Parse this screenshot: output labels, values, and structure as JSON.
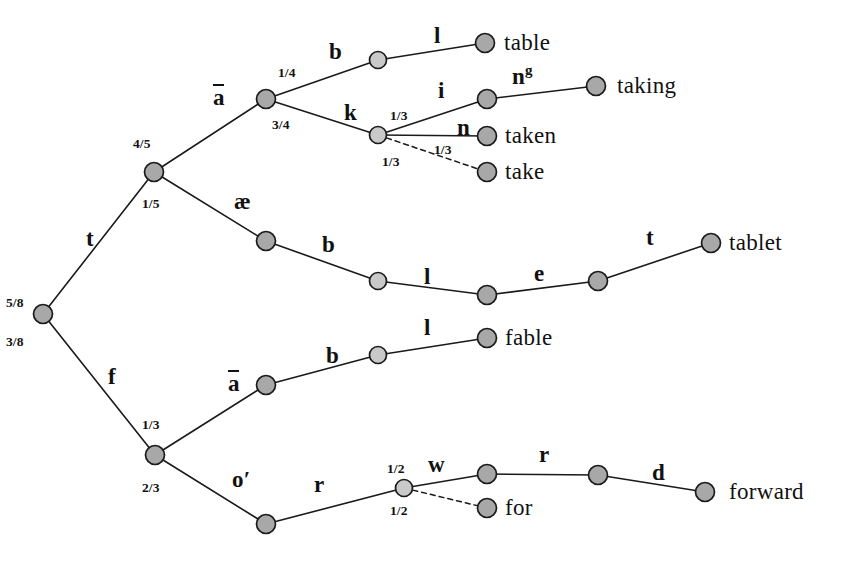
{
  "figure": {
    "type": "probabilistic-lexical-tree",
    "canvas": {
      "width": 847,
      "height": 564,
      "background": "#ffffff"
    },
    "style": {
      "node_fill": "#a8a8a8",
      "node_fill_light": "#c9c9c9",
      "node_stroke": "#1a1a1a",
      "edge_color": "#1a1a1a",
      "text_color": "#111111"
    }
  },
  "nodes": [
    {
      "id": "root",
      "x": 43,
      "y": 314,
      "r": 9.5,
      "shade": "dark"
    },
    {
      "id": "t",
      "x": 154,
      "y": 172,
      "r": 9.5,
      "shade": "dark"
    },
    {
      "id": "f",
      "x": 155,
      "y": 455,
      "r": 9.5,
      "shade": "dark"
    },
    {
      "id": "ta",
      "x": 266,
      "y": 99,
      "r": 9.5,
      "shade": "dark"
    },
    {
      "id": "tae",
      "x": 266,
      "y": 241,
      "r": 9.5,
      "shade": "dark"
    },
    {
      "id": "tab",
      "x": 378,
      "y": 60,
      "r": 8.5,
      "shade": "light"
    },
    {
      "id": "tak",
      "x": 378,
      "y": 135,
      "r": 8.5,
      "shade": "light"
    },
    {
      "id": "table",
      "x": 485,
      "y": 43,
      "r": 9.5,
      "shade": "dark"
    },
    {
      "id": "taki",
      "x": 487,
      "y": 99,
      "r": 9.5,
      "shade": "dark"
    },
    {
      "id": "taken",
      "x": 487,
      "y": 136,
      "r": 9.5,
      "shade": "dark"
    },
    {
      "id": "take",
      "x": 487,
      "y": 172,
      "r": 9.5,
      "shade": "dark"
    },
    {
      "id": "taking",
      "x": 596,
      "y": 86,
      "r": 9.5,
      "shade": "dark"
    },
    {
      "id": "taeb",
      "x": 378,
      "y": 281,
      "r": 8.5,
      "shade": "light"
    },
    {
      "id": "taebl",
      "x": 487,
      "y": 295,
      "r": 9.5,
      "shade": "dark"
    },
    {
      "id": "taeble",
      "x": 598,
      "y": 281,
      "r": 9.5,
      "shade": "dark"
    },
    {
      "id": "tablet",
      "x": 711,
      "y": 243,
      "r": 9.5,
      "shade": "dark"
    },
    {
      "id": "fa",
      "x": 266,
      "y": 385,
      "r": 9.5,
      "shade": "dark"
    },
    {
      "id": "fab",
      "x": 378,
      "y": 355,
      "r": 8.5,
      "shade": "light"
    },
    {
      "id": "fable",
      "x": 487,
      "y": 338,
      "r": 9.5,
      "shade": "dark"
    },
    {
      "id": "fo",
      "x": 266,
      "y": 524,
      "r": 9.5,
      "shade": "dark"
    },
    {
      "id": "for_br",
      "x": 404,
      "y": 488,
      "r": 8.5,
      "shade": "light"
    },
    {
      "id": "forw",
      "x": 487,
      "y": 474,
      "r": 9.5,
      "shade": "dark"
    },
    {
      "id": "for",
      "x": 487,
      "y": 508,
      "r": 9.5,
      "shade": "dark"
    },
    {
      "id": "forwr",
      "x": 598,
      "y": 475,
      "r": 9.5,
      "shade": "dark"
    },
    {
      "id": "forward",
      "x": 705,
      "y": 492,
      "r": 9.5,
      "shade": "dark"
    }
  ],
  "edges": [
    {
      "from": "root",
      "to": "t",
      "symbol": "t",
      "prob": "5/8",
      "dashed": false
    },
    {
      "from": "root",
      "to": "f",
      "symbol": "f",
      "prob": "3/8",
      "dashed": false
    },
    {
      "from": "t",
      "to": "ta",
      "symbol": "a",
      "prob": "4/5",
      "dashed": false
    },
    {
      "from": "t",
      "to": "tae",
      "symbol": "æ",
      "prob": "1/5",
      "dashed": false
    },
    {
      "from": "ta",
      "to": "tab",
      "symbol": "b",
      "prob": "1/4",
      "dashed": false
    },
    {
      "from": "ta",
      "to": "tak",
      "symbol": "k",
      "prob": "3/4",
      "dashed": false
    },
    {
      "from": "tab",
      "to": "table",
      "symbol": "l",
      "prob": "",
      "dashed": false
    },
    {
      "from": "tak",
      "to": "taki",
      "symbol": "i",
      "prob": "1/3",
      "dashed": false
    },
    {
      "from": "tak",
      "to": "taken",
      "symbol": "n",
      "prob": "1/3",
      "dashed": false
    },
    {
      "from": "tak",
      "to": "take",
      "symbol": "",
      "prob": "1/3",
      "dashed": true
    },
    {
      "from": "taki",
      "to": "taking",
      "symbol": "ng",
      "prob": "",
      "dashed": false
    },
    {
      "from": "tae",
      "to": "taeb",
      "symbol": "b",
      "prob": "",
      "dashed": false
    },
    {
      "from": "taeb",
      "to": "taebl",
      "symbol": "l",
      "prob": "",
      "dashed": false
    },
    {
      "from": "taebl",
      "to": "taeble",
      "symbol": "e",
      "prob": "",
      "dashed": false
    },
    {
      "from": "taeble",
      "to": "tablet",
      "symbol": "t",
      "prob": "",
      "dashed": false
    },
    {
      "from": "f",
      "to": "fa",
      "symbol": "a",
      "prob": "1/3",
      "dashed": false
    },
    {
      "from": "f",
      "to": "fo",
      "symbol": "o'",
      "prob": "2/3",
      "dashed": false
    },
    {
      "from": "fa",
      "to": "fab",
      "symbol": "b",
      "prob": "",
      "dashed": false
    },
    {
      "from": "fab",
      "to": "fable",
      "symbol": "l",
      "prob": "",
      "dashed": false
    },
    {
      "from": "fo",
      "to": "for_br",
      "symbol": "r",
      "prob": "",
      "dashed": false
    },
    {
      "from": "for_br",
      "to": "forw",
      "symbol": "w",
      "prob": "1/2",
      "dashed": false
    },
    {
      "from": "for_br",
      "to": "for",
      "symbol": "",
      "prob": "1/2",
      "dashed": true
    },
    {
      "from": "forw",
      "to": "forwr",
      "symbol": "r",
      "prob": "",
      "dashed": false
    },
    {
      "from": "forwr",
      "to": "forward",
      "symbol": "d",
      "prob": "",
      "dashed": false
    }
  ],
  "symbol_labels": [
    {
      "id": "sym-t",
      "text": "t",
      "x": 86,
      "y": 227,
      "macron": false,
      "sup": ""
    },
    {
      "id": "sym-f",
      "text": "f",
      "x": 108,
      "y": 365,
      "macron": false,
      "sup": ""
    },
    {
      "id": "sym-a-upper",
      "text": "a",
      "x": 213,
      "y": 86,
      "macron": true,
      "sup": ""
    },
    {
      "id": "sym-ae",
      "text": "æ",
      "x": 234,
      "y": 190,
      "macron": false,
      "sup": ""
    },
    {
      "id": "sym-b1",
      "text": "b",
      "x": 329,
      "y": 40,
      "macron": false,
      "sup": ""
    },
    {
      "id": "sym-k",
      "text": "k",
      "x": 344,
      "y": 101,
      "macron": false,
      "sup": ""
    },
    {
      "id": "sym-l1",
      "text": "l",
      "x": 434,
      "y": 24,
      "macron": false,
      "sup": ""
    },
    {
      "id": "sym-i",
      "text": "i",
      "x": 438,
      "y": 79,
      "macron": false,
      "sup": ""
    },
    {
      "id": "sym-ng",
      "text": "n",
      "x": 512,
      "y": 63,
      "macron": false,
      "sup": "g"
    },
    {
      "id": "sym-n",
      "text": "n",
      "x": 457,
      "y": 116,
      "macron": false,
      "sup": ""
    },
    {
      "id": "sym-b2",
      "text": "b",
      "x": 322,
      "y": 233,
      "macron": false,
      "sup": ""
    },
    {
      "id": "sym-l2",
      "text": "l",
      "x": 424,
      "y": 265,
      "macron": false,
      "sup": ""
    },
    {
      "id": "sym-e",
      "text": "e",
      "x": 534,
      "y": 262,
      "macron": false,
      "sup": ""
    },
    {
      "id": "sym-t2",
      "text": "t",
      "x": 646,
      "y": 226,
      "macron": false,
      "sup": ""
    },
    {
      "id": "sym-a-lower",
      "text": "a",
      "x": 228,
      "y": 372,
      "macron": true,
      "sup": ""
    },
    {
      "id": "sym-b3",
      "text": "b",
      "x": 326,
      "y": 344,
      "macron": false,
      "sup": ""
    },
    {
      "id": "sym-l3",
      "text": "l",
      "x": 424,
      "y": 316,
      "macron": false,
      "sup": ""
    },
    {
      "id": "sym-oprime",
      "text": "o′",
      "x": 232,
      "y": 468,
      "macron": false,
      "sup": ""
    },
    {
      "id": "sym-r1",
      "text": "r",
      "x": 314,
      "y": 473,
      "macron": false,
      "sup": ""
    },
    {
      "id": "sym-w",
      "text": "w",
      "x": 428,
      "y": 453,
      "macron": false,
      "sup": ""
    },
    {
      "id": "sym-r2",
      "text": "r",
      "x": 539,
      "y": 443,
      "macron": false,
      "sup": ""
    },
    {
      "id": "sym-d",
      "text": "d",
      "x": 652,
      "y": 461,
      "macron": false,
      "sup": ""
    }
  ],
  "prob_labels": [
    {
      "id": "prob-5-8",
      "text": "5/8",
      "x": 6,
      "y": 296
    },
    {
      "id": "prob-3-8",
      "text": "3/8",
      "x": 6,
      "y": 335
    },
    {
      "id": "prob-4-5",
      "text": "4/5",
      "x": 133,
      "y": 137
    },
    {
      "id": "prob-1-5",
      "text": "1/5",
      "x": 142,
      "y": 197
    },
    {
      "id": "prob-1-4",
      "text": "1/4",
      "x": 278,
      "y": 66
    },
    {
      "id": "prob-3-4",
      "text": "3/4",
      "x": 272,
      "y": 118
    },
    {
      "id": "prob-1-3a",
      "text": "1/3",
      "x": 390,
      "y": 109
    },
    {
      "id": "prob-1-3b",
      "text": "1/3",
      "x": 434,
      "y": 143
    },
    {
      "id": "prob-1-3c",
      "text": "1/3",
      "x": 382,
      "y": 155
    },
    {
      "id": "prob-1-3d",
      "text": "1/3",
      "x": 142,
      "y": 418
    },
    {
      "id": "prob-2-3",
      "text": "2/3",
      "x": 142,
      "y": 481
    },
    {
      "id": "prob-1-2a",
      "text": "1/2",
      "x": 387,
      "y": 462
    },
    {
      "id": "prob-1-2b",
      "text": "1/2",
      "x": 390,
      "y": 504
    }
  ],
  "word_labels": [
    {
      "id": "word-table",
      "text": "table",
      "x": 504,
      "y": 31
    },
    {
      "id": "word-taking",
      "text": "taking",
      "x": 617,
      "y": 74
    },
    {
      "id": "word-taken",
      "text": "taken",
      "x": 505,
      "y": 124
    },
    {
      "id": "word-take",
      "text": "take",
      "x": 505,
      "y": 160
    },
    {
      "id": "word-tablet",
      "text": "tablet",
      "x": 729,
      "y": 231
    },
    {
      "id": "word-fable",
      "text": "fable",
      "x": 505,
      "y": 326
    },
    {
      "id": "word-for",
      "text": "for",
      "x": 505,
      "y": 496
    },
    {
      "id": "word-forward",
      "text": "forward",
      "x": 729,
      "y": 480
    }
  ]
}
